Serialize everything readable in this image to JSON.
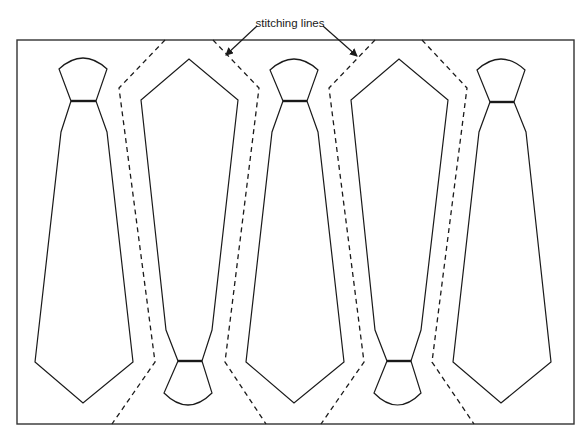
{
  "diagram": {
    "title_label": "stitching lines",
    "colors": {
      "stroke": "#1a1a1a",
      "frame": "#333333",
      "background": "#ffffff"
    },
    "frame": {
      "x": 17,
      "y": 40,
      "width": 557,
      "height": 384
    },
    "annotation": {
      "text": "stitching lines",
      "text_x": 290,
      "text_y": 27,
      "arrows": [
        {
          "from": [
            257,
            26
          ],
          "to": [
            226,
            55
          ]
        },
        {
          "from": [
            323,
            26
          ],
          "to": [
            357,
            56
          ]
        }
      ]
    },
    "ties": [
      {
        "name": "tie-1",
        "orientation": "upright",
        "knot": {
          "tl": [
            59,
            69
          ],
          "tr": [
            107,
            69
          ],
          "arc_peak_y": 58,
          "bl": [
            71,
            101
          ],
          "br": [
            96,
            101
          ]
        },
        "body": {
          "shoulder_l": [
            61,
            132
          ],
          "shoulder_r": [
            107,
            132
          ],
          "wing_l": [
            35,
            362
          ],
          "wing_r": [
            133,
            362
          ],
          "tip": [
            83,
            403
          ]
        }
      },
      {
        "name": "tie-2",
        "orientation": "inverted",
        "knot": {
          "tl": [
            178,
            361
          ],
          "tr": [
            202,
            361
          ],
          "arc_peak_y": 405,
          "bl": [
            164,
            393
          ],
          "br": [
            212,
            393
          ]
        },
        "body": {
          "shoulder_l": [
            166,
            330
          ],
          "shoulder_r": [
            212,
            330
          ],
          "wing_l": [
            141,
            100
          ],
          "wing_r": [
            238,
            100
          ],
          "tip": [
            189,
            59
          ]
        }
      },
      {
        "name": "tie-3",
        "orientation": "upright",
        "knot": {
          "tl": [
            270,
            70
          ],
          "tr": [
            318,
            70
          ],
          "arc_peak_y": 59,
          "bl": [
            283,
            101
          ],
          "br": [
            307,
            101
          ]
        },
        "body": {
          "shoulder_l": [
            272,
            132
          ],
          "shoulder_r": [
            318,
            132
          ],
          "wing_l": [
            246,
            362
          ],
          "wing_r": [
            344,
            362
          ],
          "tip": [
            294,
            403
          ]
        }
      },
      {
        "name": "tie-4",
        "orientation": "inverted",
        "knot": {
          "tl": [
            387,
            361
          ],
          "tr": [
            411,
            361
          ],
          "arc_peak_y": 405,
          "bl": [
            374,
            393
          ],
          "br": [
            421,
            393
          ]
        },
        "body": {
          "shoulder_l": [
            375,
            330
          ],
          "shoulder_r": [
            421,
            330
          ],
          "wing_l": [
            351,
            100
          ],
          "wing_r": [
            448,
            100
          ],
          "tip": [
            399,
            59
          ]
        }
      },
      {
        "name": "tie-5",
        "orientation": "upright",
        "knot": {
          "tl": [
            477,
            70
          ],
          "tr": [
            525,
            70
          ],
          "arc_peak_y": 59,
          "bl": [
            490,
            102
          ],
          "br": [
            514,
            102
          ]
        },
        "body": {
          "shoulder_l": [
            479,
            132
          ],
          "shoulder_r": [
            526,
            132
          ],
          "wing_l": [
            453,
            362
          ],
          "wing_r": [
            551,
            362
          ],
          "tip": [
            501,
            403
          ]
        }
      }
    ],
    "stitching_lines": [
      {
        "name": "stitch-1",
        "points": [
          [
            165,
            40
          ],
          [
            119,
            88
          ],
          [
            155,
            362
          ],
          [
            112,
            424
          ]
        ]
      },
      {
        "name": "stitch-2",
        "points": [
          [
            213,
            40
          ],
          [
            259,
            88
          ],
          [
            225,
            362
          ],
          [
            266,
            424
          ]
        ]
      },
      {
        "name": "stitch-3",
        "points": [
          [
            375,
            40
          ],
          [
            329,
            88
          ],
          [
            364,
            362
          ],
          [
            321,
            424
          ]
        ]
      },
      {
        "name": "stitch-4",
        "points": [
          [
            422,
            40
          ],
          [
            467,
            88
          ],
          [
            432,
            362
          ],
          [
            474,
            424
          ]
        ]
      }
    ]
  }
}
